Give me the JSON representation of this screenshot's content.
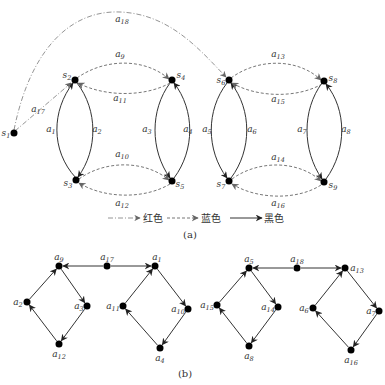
{
  "figure_a": {
    "caption": "(a)",
    "nodes": [
      {
        "id": "s1",
        "label": "s",
        "sub": "1"
      },
      {
        "id": "s2",
        "label": "s",
        "sub": "2"
      },
      {
        "id": "s3",
        "label": "s",
        "sub": "3"
      },
      {
        "id": "s4",
        "label": "s",
        "sub": "4"
      },
      {
        "id": "s5",
        "label": "s",
        "sub": "5"
      },
      {
        "id": "s6",
        "label": "s",
        "sub": "6"
      },
      {
        "id": "s7",
        "label": "s",
        "sub": "7"
      },
      {
        "id": "s8",
        "label": "s",
        "sub": "8"
      },
      {
        "id": "s9",
        "label": "s",
        "sub": "9"
      }
    ],
    "edges": [
      {
        "id": "a1",
        "from": "s3",
        "to": "s2",
        "type": "black",
        "label": "a",
        "sub": "1"
      },
      {
        "id": "a2",
        "from": "s2",
        "to": "s3",
        "type": "black",
        "label": "a",
        "sub": "2"
      },
      {
        "id": "a3",
        "from": "s4",
        "to": "s5",
        "type": "black",
        "label": "a",
        "sub": "3"
      },
      {
        "id": "a4",
        "from": "s5",
        "to": "s4",
        "type": "black",
        "label": "a",
        "sub": "4"
      },
      {
        "id": "a5",
        "from": "s6",
        "to": "s7",
        "type": "black",
        "label": "a",
        "sub": "5"
      },
      {
        "id": "a6",
        "from": "s7",
        "to": "s6",
        "type": "black",
        "label": "a",
        "sub": "6"
      },
      {
        "id": "a7",
        "from": "s8",
        "to": "s9",
        "type": "black",
        "label": "a",
        "sub": "7"
      },
      {
        "id": "a8",
        "from": "s9",
        "to": "s8",
        "type": "black",
        "label": "a",
        "sub": "8"
      },
      {
        "id": "a9",
        "from": "s2",
        "to": "s4",
        "type": "blue",
        "label": "a",
        "sub": "9"
      },
      {
        "id": "a10",
        "from": "s3",
        "to": "s5",
        "type": "blue",
        "label": "a",
        "sub": "10"
      },
      {
        "id": "a11",
        "from": "s4",
        "to": "s2",
        "type": "blue",
        "label": "a",
        "sub": "11"
      },
      {
        "id": "a12",
        "from": "s5",
        "to": "s3",
        "type": "blue",
        "label": "a",
        "sub": "12"
      },
      {
        "id": "a13",
        "from": "s6",
        "to": "s8",
        "type": "blue",
        "label": "a",
        "sub": "13"
      },
      {
        "id": "a14",
        "from": "s7",
        "to": "s9",
        "type": "blue",
        "label": "a",
        "sub": "14"
      },
      {
        "id": "a15",
        "from": "s8",
        "to": "s6",
        "type": "blue",
        "label": "a",
        "sub": "15"
      },
      {
        "id": "a16",
        "from": "s9",
        "to": "s7",
        "type": "blue",
        "label": "a",
        "sub": "16"
      },
      {
        "id": "a17",
        "from": "s1",
        "to": "s2",
        "type": "red",
        "label": "a",
        "sub": "17"
      },
      {
        "id": "a18",
        "from": "s1",
        "to": "s6",
        "type": "red",
        "label": "a",
        "sub": "18"
      }
    ],
    "legend": [
      {
        "type": "red",
        "label": "红色"
      },
      {
        "type": "blue",
        "label": "蓝色"
      },
      {
        "type": "black",
        "label": "黑色"
      }
    ]
  },
  "figure_b": {
    "caption": "(b)",
    "nodes": [
      {
        "id": "a9",
        "label": "a",
        "sub": "9"
      },
      {
        "id": "a17",
        "label": "a",
        "sub": "17"
      },
      {
        "id": "a1",
        "label": "a",
        "sub": "1"
      },
      {
        "id": "a2",
        "label": "a",
        "sub": "2"
      },
      {
        "id": "a3",
        "label": "a",
        "sub": "3"
      },
      {
        "id": "a12",
        "label": "a",
        "sub": "12"
      },
      {
        "id": "a11",
        "label": "a",
        "sub": "11"
      },
      {
        "id": "a10",
        "label": "a",
        "sub": "10"
      },
      {
        "id": "a4",
        "label": "a",
        "sub": "4"
      },
      {
        "id": "a5",
        "label": "a",
        "sub": "5"
      },
      {
        "id": "a18",
        "label": "a",
        "sub": "18"
      },
      {
        "id": "a13",
        "label": "a",
        "sub": "13"
      },
      {
        "id": "a15",
        "label": "a",
        "sub": "15"
      },
      {
        "id": "a14",
        "label": "a",
        "sub": "14"
      },
      {
        "id": "a8",
        "label": "a",
        "sub": "8"
      },
      {
        "id": "a6",
        "label": "a",
        "sub": "6"
      },
      {
        "id": "a7",
        "label": "a",
        "sub": "7"
      },
      {
        "id": "a16",
        "label": "a",
        "sub": "16"
      }
    ],
    "edges": [
      {
        "from": "a17",
        "to": "a9"
      },
      {
        "from": "a17",
        "to": "a1"
      },
      {
        "from": "a9",
        "to": "a3"
      },
      {
        "from": "a3",
        "to": "a12"
      },
      {
        "from": "a12",
        "to": "a2"
      },
      {
        "from": "a2",
        "to": "a9"
      },
      {
        "from": "a1",
        "to": "a10"
      },
      {
        "from": "a10",
        "to": "a4"
      },
      {
        "from": "a4",
        "to": "a11"
      },
      {
        "from": "a11",
        "to": "a1"
      },
      {
        "from": "a18",
        "to": "a5"
      },
      {
        "from": "a18",
        "to": "a13"
      },
      {
        "from": "a5",
        "to": "a14"
      },
      {
        "from": "a14",
        "to": "a8"
      },
      {
        "from": "a8",
        "to": "a15"
      },
      {
        "from": "a15",
        "to": "a5"
      },
      {
        "from": "a13",
        "to": "a7"
      },
      {
        "from": "a7",
        "to": "a16"
      },
      {
        "from": "a16",
        "to": "a6"
      },
      {
        "from": "a6",
        "to": "a13"
      }
    ]
  }
}
